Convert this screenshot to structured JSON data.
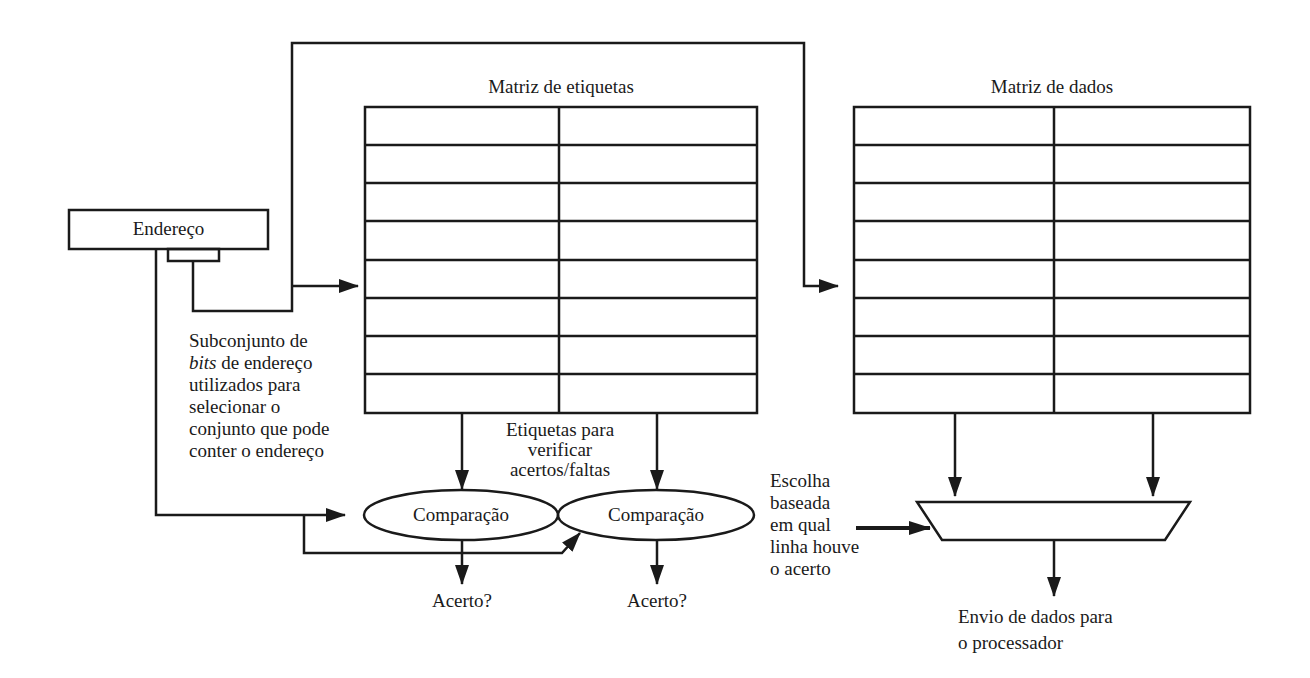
{
  "figure": {
    "address_box": {
      "label": "Endereço"
    },
    "tag_array": {
      "title": "Matriz de etiquetas",
      "rows": 8,
      "columns": 2
    },
    "data_array": {
      "title": "Matriz de dados",
      "rows": 8,
      "columns": 2
    },
    "subset_note": {
      "line1": "Subconjunto de",
      "line2_italic": "bits",
      "line2_rest": " de endereço",
      "line3": "utilizados para",
      "line4": "selecionar o",
      "line5": "conjunto que pode",
      "line6": "conter o endereço"
    },
    "tags_note": {
      "line1": "Etiquetas para",
      "line2": "verificar",
      "line3": "acertos/faltas"
    },
    "comparators": [
      {
        "label": "Comparação",
        "output": "Acerto?"
      },
      {
        "label": "Comparação",
        "output": "Acerto?"
      }
    ],
    "mux_note": {
      "line1": "Escolha",
      "line2": "baseada",
      "line3": "em qual",
      "line4": "linha houve",
      "line5": "o acerto"
    },
    "output_note": {
      "line1": "Envio de dados para",
      "line2": "o processador"
    }
  },
  "colors": {
    "stroke": "#1a1a1a",
    "background": "#ffffff"
  }
}
